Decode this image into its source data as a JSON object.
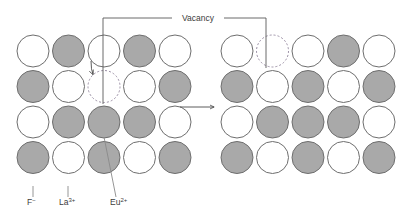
{
  "diagram": {
    "title_label": "Vacancy",
    "legend": [
      {
        "id": "fluoride",
        "label": "F",
        "charge": "−",
        "species": "fluoride-ion",
        "color": "#a9a9a9"
      },
      {
        "id": "lanthanum",
        "label": "La",
        "charge": "3+",
        "species": "lanthanum-ion",
        "color": "#ffffff"
      },
      {
        "id": "europium",
        "label": "Eu",
        "charge": "2+",
        "species": "europium-ion",
        "color": "#a9a9a9"
      }
    ],
    "colors": {
      "gray_fill": "#a9a9a9",
      "white_fill": "#ffffff",
      "circle_stroke": "#6e6e6e",
      "vacancy_stroke": "#9b8fa5",
      "leader_line": "#5a5a5a",
      "text": "#3c3c3c"
    },
    "geometry": {
      "circle_radius": 16,
      "column_pitch": 35.5,
      "row_pitch": 35.5,
      "rows": 4,
      "columns": 5
    },
    "panels": [
      {
        "id": "before",
        "name": "left-lattice",
        "origin_x": 33,
        "origin_y": 51,
        "grid": [
          [
            "white",
            "gray",
            "white",
            "gray",
            "white"
          ],
          [
            "gray",
            "white",
            "vacancy",
            "white",
            "gray"
          ],
          [
            "white",
            "gray",
            "gray",
            "gray",
            "white"
          ],
          [
            "gray",
            "white",
            "gray",
            "white",
            "gray"
          ]
        ],
        "vacancy_cell": {
          "row": 1,
          "col": 2
        },
        "hop_arrow": {
          "from_row": 0,
          "from_col": 2,
          "to_row": 1,
          "to_col": 2
        }
      },
      {
        "id": "after",
        "name": "right-lattice",
        "origin_x": 237,
        "origin_y": 51,
        "grid": [
          [
            "white",
            "vacancy",
            "white",
            "gray",
            "white"
          ],
          [
            "gray",
            "white",
            "gray",
            "white",
            "gray"
          ],
          [
            "white",
            "gray",
            "gray",
            "gray",
            "white"
          ],
          [
            "gray",
            "white",
            "gray",
            "white",
            "gray"
          ]
        ],
        "vacancy_cell": {
          "row": 0,
          "col": 1
        },
        "hop_arrow": null
      }
    ],
    "transition_arrow": {
      "name": "transition-arrow",
      "x1": 180,
      "x2": 214,
      "y": 107
    },
    "callout": {
      "text_x": 198,
      "text_y": 21,
      "bar_y": 18,
      "left_bar_x1": 103,
      "left_bar_x2": 172,
      "right_bar_x1": 224,
      "right_bar_x2": 266,
      "left_drop_x": 103,
      "left_drop_y": 104,
      "right_drop_x": 266,
      "right_drop_y": 68
    },
    "legend_positions": [
      {
        "id": "fluoride",
        "text_x": 27,
        "text_y": 205,
        "line_x": 33,
        "line_y1": 186,
        "line_y2": 197
      },
      {
        "id": "lanthanum",
        "text_x": 59,
        "text_y": 205,
        "line_x": 68,
        "line_y1": 186,
        "line_y2": 197
      },
      {
        "id": "europium",
        "text_x": 110,
        "text_y": 205,
        "line_x1": 104,
        "line_y1": 137,
        "line_x2": 116,
        "line_y2": 197
      }
    ]
  }
}
